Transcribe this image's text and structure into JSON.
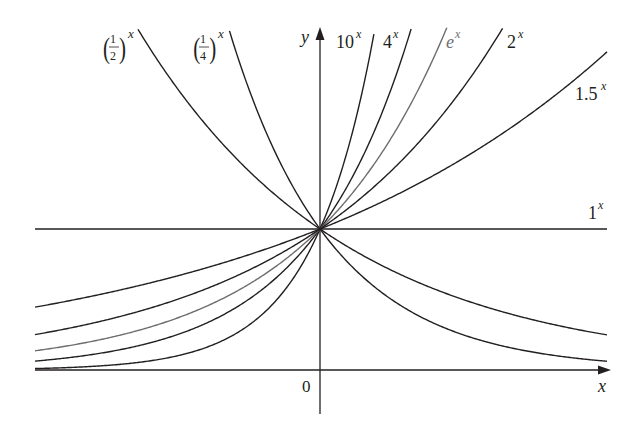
{
  "chart_data": {
    "type": "line",
    "title": "",
    "xlabel": "x",
    "ylabel": "y",
    "origin_label": "0",
    "xlim": [
      -2.0,
      2.0
    ],
    "ylim": [
      0,
      2.41
    ],
    "grid": false,
    "legend": "inline labels at curve ends",
    "series": [
      {
        "name": "(1/2)^x",
        "base": 0.5,
        "label_base": "(1/2)",
        "label_exp": "x",
        "color": "#231f20"
      },
      {
        "name": "(1/4)^x",
        "base": 0.25,
        "label_base": "(1/4)",
        "label_exp": "x",
        "color": "#231f20"
      },
      {
        "name": "10^x",
        "base": 10,
        "label_base": "10",
        "label_exp": "x",
        "color": "#231f20"
      },
      {
        "name": "4^x",
        "base": 4,
        "label_base": "4",
        "label_exp": "x",
        "color": "#231f20"
      },
      {
        "name": "e^x",
        "base": 2.718281828,
        "label_base": "e",
        "label_exp": "x",
        "color": "#6d6e71"
      },
      {
        "name": "2^x",
        "base": 2,
        "label_base": "2",
        "label_exp": "x",
        "color": "#231f20"
      },
      {
        "name": "1.5^x",
        "base": 1.5,
        "label_base": "1.5",
        "label_exp": "x",
        "color": "#231f20"
      },
      {
        "name": "1^x",
        "base": 1,
        "label_base": "1",
        "label_exp": "x",
        "color": "#231f20"
      }
    ],
    "sample_points": {
      "x": [
        -2,
        -1,
        0,
        1,
        2
      ],
      "1.5^x": [
        0.444,
        0.667,
        1,
        1.5,
        2.25
      ],
      "2^x": [
        0.25,
        0.5,
        1,
        2,
        4
      ],
      "e^x": [
        0.135,
        0.368,
        1,
        2.718,
        7.389
      ],
      "4^x": [
        0.0625,
        0.25,
        1,
        4,
        16
      ],
      "10^x": [
        0.01,
        0.1,
        1,
        10,
        100
      ],
      "(1/2)^x": [
        4,
        2,
        1,
        0.5,
        0.25
      ],
      "(1/4)^x": [
        16,
        4,
        1,
        0.25,
        0.0625
      ],
      "1^x": [
        1,
        1,
        1,
        1,
        1
      ]
    }
  },
  "layout": {
    "origin_px": [
      320,
      370
    ],
    "px_per_unit_x": 143,
    "px_per_unit_y": 141,
    "x_left_px": 35,
    "x_right_px": 607,
    "y_top_px": 30,
    "axis_color": "#231f20"
  }
}
